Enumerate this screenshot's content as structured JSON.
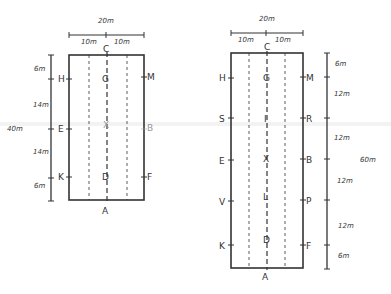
{
  "diagram": {
    "type": "dressage-arena-layouts",
    "small_arena": {
      "width_label": "20m",
      "half_labels": [
        "10m",
        "10m"
      ],
      "length_label": "40m",
      "segments": [
        "6m",
        "14m",
        "14m",
        "6m"
      ],
      "end_markers": {
        "top": "C",
        "bottom": "A"
      },
      "left_markers": [
        "H",
        "E",
        "K"
      ],
      "right_markers": [
        "M",
        "B",
        "F"
      ],
      "center_markers": [
        "G",
        "X",
        "D"
      ]
    },
    "large_arena": {
      "width_label": "20m",
      "half_labels": [
        "10m",
        "10m"
      ],
      "length_label": "60m",
      "segments": [
        "6m",
        "12m",
        "12m",
        "12m",
        "12m",
        "6m"
      ],
      "end_markers": {
        "top": "C",
        "bottom": "A"
      },
      "left_markers": [
        "H",
        "S",
        "E",
        "V",
        "K"
      ],
      "right_markers": [
        "M",
        "R",
        "B",
        "P",
        "F"
      ],
      "center_markers": [
        "G",
        "I",
        "X",
        "L",
        "D"
      ]
    }
  }
}
